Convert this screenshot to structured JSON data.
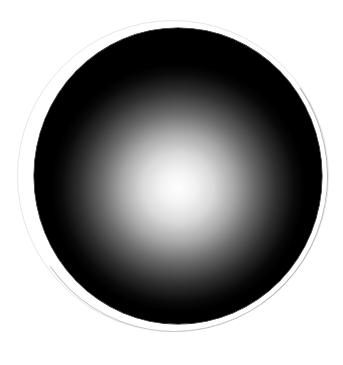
{
  "image": {
    "subject": "black circular disc with soft white radial glow at center",
    "colors": {
      "background": "#ffffff",
      "disc": "#000000",
      "glow_center": "#ffffff",
      "outer_ring": "#e6e6e6",
      "outer_ring_shadow": "#b8b8b8"
    }
  }
}
